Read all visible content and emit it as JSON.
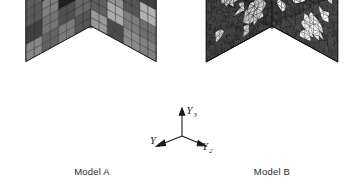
{
  "figure": {
    "type": "scientific-illustration",
    "background_color": "#ffffff"
  },
  "panels": [
    {
      "id": "model-a",
      "caption": "Model A",
      "mesh_type": "voxel",
      "geometry": "cube",
      "grid": 8,
      "description": "Cube discretised into regular hexahedral (brick) voxel elements; grains rendered in distinct grey levels"
    },
    {
      "id": "model-b",
      "caption": "Model B",
      "mesh_type": "tetrahedral",
      "geometry": "cube",
      "description": "Cube discretised with an unstructured triangular surface mesh; dark matrix with light ellipsoidal inclusions"
    }
  ],
  "axes": {
    "name": "coordinate-triad",
    "labels": {
      "y1": "Y",
      "y1_sub": "1",
      "y2": "Y",
      "y2_sub": "2",
      "y3": "Y",
      "y3_sub": "3"
    },
    "directions": {
      "y1": "down-left",
      "y2": "down-right",
      "y3": "up"
    },
    "color": "#1a1a1a"
  },
  "palette": {
    "line": "#1c1c1c",
    "text": "#2a2a2a",
    "grey_very_dark": "#2b2b2b",
    "grey_dark": "#4a4a4a",
    "grey_mid": "#7b7b7b",
    "grey_light": "#a8a8a8",
    "grey_very_light": "#cfcfcf",
    "white": "#f2f2f2",
    "matrix_dark": "#3a3a3a",
    "inclusion_light": "#e8e8e8"
  },
  "chart_data": {
    "type": "table",
    "model_a_top_face_grey_levels": [
      [
        0.3,
        0.3,
        0.55,
        0.55,
        0.7,
        0.7,
        0.18,
        0.18
      ],
      [
        0.3,
        0.3,
        0.55,
        0.55,
        0.7,
        0.7,
        0.18,
        0.18
      ],
      [
        0.62,
        0.62,
        0.44,
        0.95,
        0.95,
        0.44,
        0.52,
        0.52
      ],
      [
        0.62,
        0.62,
        0.44,
        0.95,
        0.95,
        0.44,
        0.52,
        0.52
      ],
      [
        0.48,
        0.48,
        0.78,
        0.78,
        0.36,
        0.36,
        0.66,
        0.66
      ],
      [
        0.48,
        0.48,
        0.78,
        0.78,
        0.36,
        0.36,
        0.66,
        0.66
      ],
      [
        0.24,
        0.24,
        0.58,
        0.58,
        0.82,
        0.82,
        0.4,
        0.4
      ],
      [
        0.24,
        0.24,
        0.58,
        0.58,
        0.82,
        0.82,
        0.4,
        0.4
      ]
    ],
    "model_a_left_face_grey_levels": [
      [
        0.62,
        0.62,
        0.88,
        0.88,
        0.28,
        0.28,
        0.5,
        0.5
      ],
      [
        0.62,
        0.62,
        0.88,
        0.88,
        0.28,
        0.28,
        0.5,
        0.5
      ],
      [
        0.34,
        0.34,
        0.1,
        0.1,
        0.72,
        0.72,
        0.46,
        0.46
      ],
      [
        0.34,
        0.34,
        0.1,
        0.1,
        0.72,
        0.72,
        0.46,
        0.46
      ],
      [
        0.56,
        0.56,
        0.4,
        0.4,
        0.64,
        0.64,
        0.3,
        0.3
      ],
      [
        0.56,
        0.56,
        0.4,
        0.4,
        0.64,
        0.64,
        0.3,
        0.3
      ],
      [
        0.44,
        0.44,
        0.68,
        0.68,
        0.52,
        0.52,
        0.76,
        0.76
      ],
      [
        0.44,
        0.44,
        0.68,
        0.68,
        0.52,
        0.52,
        0.76,
        0.76
      ]
    ],
    "model_a_right_face_grey_levels": [
      [
        0.74,
        0.74,
        0.42,
        0.42,
        0.6,
        0.6,
        0.2,
        0.2
      ],
      [
        0.74,
        0.74,
        0.42,
        0.42,
        0.6,
        0.6,
        0.2,
        0.2
      ],
      [
        0.5,
        0.5,
        0.66,
        0.66,
        0.32,
        0.32,
        0.84,
        0.84
      ],
      [
        0.5,
        0.5,
        0.66,
        0.66,
        0.32,
        0.32,
        0.84,
        0.84
      ],
      [
        0.38,
        0.38,
        0.8,
        0.8,
        0.54,
        0.54,
        0.46,
        0.46
      ],
      [
        0.38,
        0.38,
        0.8,
        0.8,
        0.54,
        0.54,
        0.46,
        0.46
      ],
      [
        0.7,
        0.7,
        0.26,
        0.26,
        0.62,
        0.62,
        0.56,
        0.56
      ],
      [
        0.7,
        0.7,
        0.26,
        0.26,
        0.62,
        0.62,
        0.56,
        0.56
      ]
    ],
    "model_b_inclusion_count_visible": 14,
    "xlabel": "",
    "ylabel": ""
  }
}
